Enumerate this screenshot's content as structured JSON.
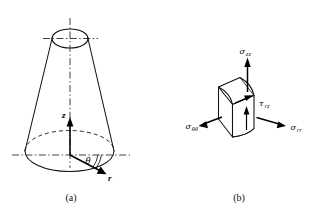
{
  "figure": {
    "background_color": "#ffffff",
    "line_color": "#111111",
    "panels": [
      {
        "caption": "(a)",
        "name": "truncated-cone-cylindrical-coordinates",
        "axis_labels": {
          "z": "z",
          "theta": "θ",
          "r": "r"
        }
      },
      {
        "caption": "(b)",
        "name": "stress-element",
        "stress_labels": {
          "sigma_zz": {
            "symbol": "σ",
            "subscript": "zz"
          },
          "sigma_theta_theta": {
            "symbol": "σ",
            "subscript": "θθ"
          },
          "sigma_rr": {
            "symbol": "σ",
            "subscript": "rr"
          },
          "tau_rz": {
            "symbol": "τ",
            "subscript": "rz"
          }
        }
      }
    ]
  }
}
